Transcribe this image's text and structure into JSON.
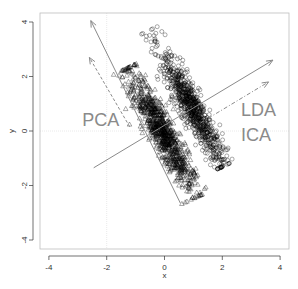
{
  "chart_data": {
    "type": "scatter",
    "title": "",
    "xlabel": "x",
    "ylabel": "y",
    "xlim": [
      -4.2,
      4.3
    ],
    "ylim": [
      -4.3,
      4.3
    ],
    "xticks": [
      -4,
      -2,
      0,
      2,
      4
    ],
    "yticks": [
      -4,
      -2,
      0,
      2,
      4
    ],
    "xtick_labels": [
      "-4",
      "-2",
      "0",
      "2",
      "4"
    ],
    "ytick_labels": [
      "-4",
      "-2",
      "0",
      "2",
      "4"
    ],
    "grid": {
      "x": [
        -2
      ],
      "y": [
        0
      ],
      "style": "dotted light grey"
    },
    "series": [
      {
        "name": "class 1",
        "marker": "triangle",
        "color": "#000000",
        "n": 900,
        "center": [
          -0.1,
          0.0
        ],
        "direction": [
          0.5,
          -1.0
        ],
        "spread_major": 1.25,
        "spread_minor": 0.22,
        "extent_major": [
          -2.6,
          2.7
        ]
      },
      {
        "name": "class 2",
        "marker": "circle",
        "color": "#000000",
        "n": 800,
        "center": [
          0.95,
          0.85
        ],
        "direction": [
          0.5,
          -1.0
        ],
        "spread_major": 1.15,
        "spread_minor": 0.2,
        "extent_major": [
          -3.2,
          2.4
        ]
      }
    ],
    "arrows": [
      {
        "name": "pca-direction",
        "from": [
          0.55,
          -2.65
        ],
        "to": [
          -2.55,
          4.05
        ],
        "style": "solid",
        "color": "#8a8a8a",
        "label": ""
      },
      {
        "name": "pca-dashed",
        "from": [
          -1.2,
          0.15
        ],
        "to": [
          -2.6,
          2.7
        ],
        "style": "dashed",
        "color": "#8a8a8a",
        "label": "PCA"
      },
      {
        "name": "lda-direction",
        "from": [
          -2.45,
          -1.35
        ],
        "to": [
          3.75,
          2.6
        ],
        "style": "solid",
        "color": "#8a8a8a",
        "label": "LDA"
      },
      {
        "name": "ica-direction",
        "from": [
          1.25,
          0.3
        ],
        "to": [
          3.6,
          1.8
        ],
        "style": "dotdash",
        "color": "#8a8a8a",
        "label": "ICA"
      }
    ],
    "annotations": [
      {
        "text": "PCA",
        "x": -2.85,
        "y": 0.2
      },
      {
        "text": "LDA",
        "x": 2.65,
        "y": 0.55
      },
      {
        "text": "ICA",
        "x": 2.65,
        "y": -0.35
      }
    ]
  }
}
